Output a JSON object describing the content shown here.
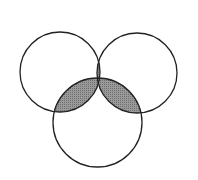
{
  "diagram": {
    "type": "venn-3",
    "stroke_color": "#222222",
    "fill_color": "#8a8a8a",
    "background": "#ffffff",
    "circles": [
      {
        "name": "left",
        "cx": 60,
        "cy": 72,
        "r": 40
      },
      {
        "name": "right",
        "cx": 137,
        "cy": 73,
        "r": 40
      },
      {
        "name": "bottom",
        "cx": 97.5,
        "cy": 122.5,
        "r": 44.5
      }
    ],
    "shaded_regions": [
      "left∩right",
      "left∩bottom",
      "right∩bottom"
    ]
  }
}
